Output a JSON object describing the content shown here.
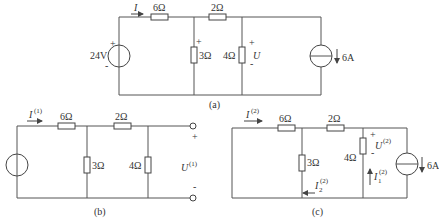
{
  "circuits": {
    "a": {
      "caption": "(a)",
      "current_label": "I",
      "resistors": {
        "r_series_1": "6Ω",
        "r_series_2": "2Ω",
        "r_shunt_1": "3Ω",
        "r_shunt_2": "4Ω"
      },
      "voltage_source": "24V",
      "current_source": "6A",
      "voltage_label": "U",
      "plus": "+",
      "minus": "-"
    },
    "b": {
      "caption": "(b)",
      "current_label": "I",
      "current_sup": "(1)",
      "resistors": {
        "r_series_1": "6Ω",
        "r_series_2": "2Ω",
        "r_shunt_1": "3Ω",
        "r_shunt_2": "4Ω"
      },
      "voltage_label": "U",
      "voltage_sup": "(1)",
      "plus": "+",
      "minus": "-"
    },
    "c": {
      "caption": "(c)",
      "current_label": "I",
      "current_sup": "(2)",
      "resistors": {
        "r_series_1": "6Ω",
        "r_series_2": "2Ω",
        "r_shunt_1": "3Ω",
        "r_shunt_2": "4Ω"
      },
      "voltage_label": "U",
      "voltage_sup": "(2)",
      "i1_label": "I",
      "i1_sub": "1",
      "i1_sup": "(2)",
      "i2_label": "I",
      "i2_sub": "2",
      "i2_sup": "(2)",
      "current_source": "6A",
      "plus": "+",
      "minus": "-"
    }
  }
}
